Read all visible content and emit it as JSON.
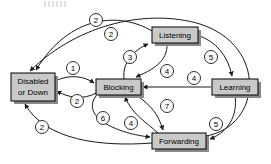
{
  "diagram": {
    "background_color": "#ffffff",
    "node_fill_color": "#c9c9c9",
    "node_border_color": "#000000",
    "edge_color": "#1a1a1a",
    "badge_fill_color": "#ffffff",
    "nodes": [
      {
        "id": "disabled",
        "label_line1": "Disabled",
        "label_line2": "or Down",
        "x": 11,
        "y": 73,
        "w": 44,
        "h": 28
      },
      {
        "id": "blocking",
        "label_line1": "Blocking",
        "label_line2": "",
        "x": 96,
        "y": 79,
        "w": 45,
        "h": 16
      },
      {
        "id": "listening",
        "label_line1": "Listening",
        "label_line2": "",
        "x": 152,
        "y": 27,
        "w": 46,
        "h": 16
      },
      {
        "id": "learning",
        "label_line1": "Learning",
        "label_line2": "",
        "x": 212,
        "y": 79,
        "w": 46,
        "h": 16
      },
      {
        "id": "forwarding",
        "label_line1": "Forwarding",
        "label_line2": "",
        "x": 152,
        "y": 133,
        "w": 54,
        "h": 16
      }
    ],
    "transitions": [
      {
        "id": "t-listening-disabled",
        "from": "listening",
        "to": "disabled",
        "badge": "2",
        "badge_x": 96,
        "badge_y": 20
      },
      {
        "id": "t-forwarding-disabled-top",
        "from": "forwarding",
        "to": "disabled",
        "badge": "2",
        "badge_x": 111,
        "badge_y": 34
      },
      {
        "id": "t-disabled-blocking",
        "from": "disabled",
        "to": "blocking",
        "badge": "1",
        "badge_x": 73,
        "badge_y": 68
      },
      {
        "id": "t-blocking-listening",
        "from": "blocking",
        "to": "listening",
        "badge": "3",
        "badge_x": 130,
        "badge_y": 57
      },
      {
        "id": "t-listening-blocking",
        "from": "listening",
        "to": "blocking",
        "badge": "4",
        "badge_x": 167,
        "badge_y": 71
      },
      {
        "id": "t-listening-learning",
        "from": "listening",
        "to": "learning",
        "badge": "5",
        "badge_x": 211,
        "badge_y": 57
      },
      {
        "id": "t-learning-blocking",
        "from": "learning",
        "to": "blocking",
        "badge": "4",
        "badge_x": 194,
        "badge_y": 78
      },
      {
        "id": "t-blocking-disabled",
        "from": "blocking",
        "to": "disabled",
        "badge": "2",
        "badge_x": 77,
        "badge_y": 101
      },
      {
        "id": "t-forwarding-disabled-bottom",
        "from": "forwarding",
        "to": "disabled",
        "badge": "2",
        "badge_x": 42,
        "badge_y": 127
      },
      {
        "id": "t-blocking-forwarding-lower",
        "from": "blocking",
        "to": "forwarding",
        "badge": "6",
        "badge_x": 103,
        "badge_y": 118
      },
      {
        "id": "t-forwarding-blocking",
        "from": "forwarding",
        "to": "blocking",
        "badge": "4",
        "badge_x": 131,
        "badge_y": 123
      },
      {
        "id": "t-blocking-forwarding",
        "from": "blocking",
        "to": "forwarding",
        "badge": "7",
        "badge_x": 167,
        "badge_y": 106
      },
      {
        "id": "t-learning-forwarding",
        "from": "learning",
        "to": "forwarding",
        "badge": "5",
        "badge_x": 216,
        "badge_y": 124
      }
    ]
  }
}
